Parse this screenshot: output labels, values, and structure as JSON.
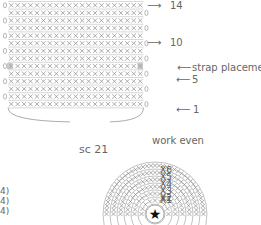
{
  "diagram": {
    "type": "crochet-chart",
    "rect_chart": {
      "rows": 14,
      "stitches_per_row": 21,
      "stitch_symbol": "×",
      "chain_marker": "0",
      "stitch_color": "#8a8a8a",
      "row_line_color": "#bdbdbd",
      "highlight_color": "#9e9e9e"
    },
    "labels": {
      "row_14": "14",
      "row_10": "10",
      "strap": "strap placement",
      "row_5": "5",
      "row_1": "1",
      "stitch_count": "sc 21",
      "work_even": "work even"
    },
    "round_chart": {
      "center_symbol": "★",
      "round_labels": [
        "X1",
        "X2",
        "X3",
        "X4",
        "X5",
        "X6"
      ]
    },
    "left_notes": [
      "4)",
      "4)",
      "4)"
    ]
  }
}
